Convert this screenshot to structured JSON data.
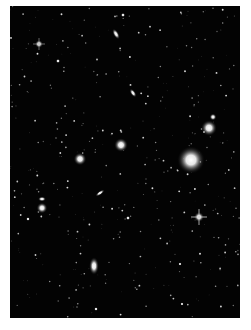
{
  "image": {
    "subject": "astronomical deep-sky field with galaxies and stars",
    "palette": {
      "background": "#030303",
      "object": "#ffffff",
      "frame": "#ffffff"
    }
  },
  "objects": [
    {
      "name": "bright-elliptical-galaxy",
      "kind": "galaxy"
    },
    {
      "name": "galaxy-upper-right",
      "kind": "galaxy"
    },
    {
      "name": "star-upper-right",
      "kind": "star"
    },
    {
      "name": "galaxy-center",
      "kind": "galaxy"
    },
    {
      "name": "galaxy-center-left",
      "kind": "galaxy"
    },
    {
      "name": "edge-on-galaxy-top",
      "kind": "galaxy"
    },
    {
      "name": "edge-on-galaxy-mid",
      "kind": "galaxy"
    },
    {
      "name": "edge-on-galaxy-lower",
      "kind": "galaxy"
    },
    {
      "name": "elliptical-galaxy-bottom",
      "kind": "galaxy"
    },
    {
      "name": "galaxy-left",
      "kind": "galaxy"
    },
    {
      "name": "galaxy-left-small",
      "kind": "galaxy"
    },
    {
      "name": "star-spiked-lower-right",
      "kind": "star"
    },
    {
      "name": "star-upper-left",
      "kind": "star"
    }
  ]
}
